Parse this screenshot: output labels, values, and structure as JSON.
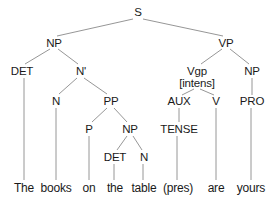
{
  "diagram": {
    "type": "syntax-tree",
    "line_color": "#8a8a8a",
    "text_color": "#1a1a1a",
    "nodes": [
      {
        "id": "S",
        "label": "S",
        "x": 138,
        "y": 12
      },
      {
        "id": "NP1",
        "label": "NP",
        "x": 54,
        "y": 43
      },
      {
        "id": "VP",
        "label": "VP",
        "x": 226,
        "y": 43
      },
      {
        "id": "DET1",
        "label": "DET",
        "x": 20,
        "y": 71
      },
      {
        "id": "Nbar",
        "label": "N'",
        "x": 80,
        "y": 71
      },
      {
        "id": "Vgp",
        "label": "Vgp",
        "x": 197,
        "y": 71
      },
      {
        "id": "Vgp2",
        "label": "[intens]",
        "x": 197,
        "y": 83
      },
      {
        "id": "NP3",
        "label": "NP",
        "x": 252,
        "y": 71
      },
      {
        "id": "N1",
        "label": "N",
        "x": 56,
        "y": 101
      },
      {
        "id": "PP",
        "label": "PP",
        "x": 111,
        "y": 101
      },
      {
        "id": "AUX",
        "label": "AUX",
        "x": 179,
        "y": 101
      },
      {
        "id": "V",
        "label": "V",
        "x": 217,
        "y": 101
      },
      {
        "id": "PRO",
        "label": "PRO",
        "x": 252,
        "y": 101
      },
      {
        "id": "P",
        "label": "P",
        "x": 89,
        "y": 129
      },
      {
        "id": "NP2",
        "label": "NP",
        "x": 130,
        "y": 129
      },
      {
        "id": "TENSE",
        "label": "TENSE",
        "x": 179,
        "y": 129
      },
      {
        "id": "DET2",
        "label": "DET",
        "x": 115,
        "y": 157
      },
      {
        "id": "N2",
        "label": "N",
        "x": 144,
        "y": 157
      }
    ],
    "words": [
      {
        "label": "The",
        "x": 24
      },
      {
        "label": "books",
        "x": 56
      },
      {
        "label": "on",
        "x": 89
      },
      {
        "label": "the",
        "x": 115
      },
      {
        "label": "table",
        "x": 143
      },
      {
        "label": "(pres)",
        "x": 177
      },
      {
        "label": "are",
        "x": 217
      },
      {
        "label": "yours",
        "x": 251
      }
    ],
    "word_y": 188
  }
}
